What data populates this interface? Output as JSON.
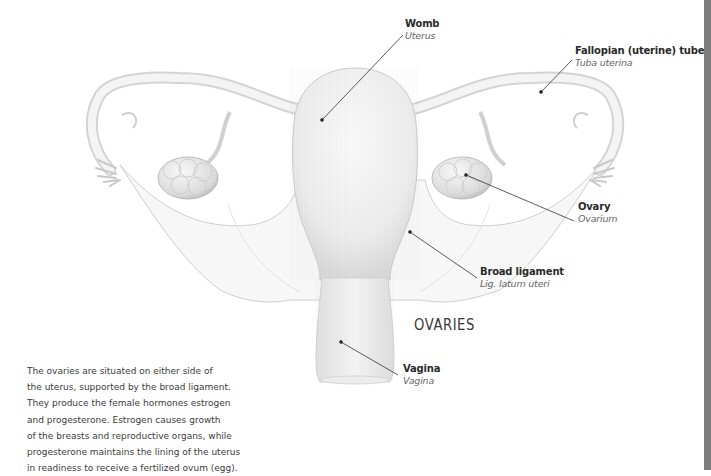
{
  "diagram": {
    "title": "OVARIES",
    "labels": {
      "womb": {
        "name": "Womb",
        "latin": "Uterus"
      },
      "fallopian_tube": {
        "name": "Fallopian (uterine) tube",
        "latin": "Tuba uterina"
      },
      "ovary": {
        "name": "Ovary",
        "latin": "Ovarium"
      },
      "broad_ligament": {
        "name": "Broad ligament",
        "latin": "Lig. latum uteri"
      },
      "vagina": {
        "name": "Vagina",
        "latin": "Vagina"
      }
    },
    "description_lines": [
      "The ovaries are situated on either side of",
      "the uterus, supported by the broad ligament.",
      "They produce the female hormones estrogen",
      "and progesterone. Estrogen causes growth",
      "of the breasts and reproductive organs, while",
      "progesterone maintains the lining of the uterus",
      "in readiness to receive a fertilized ovum (egg)."
    ],
    "colors": {
      "edge_bar": "#7d7d7d",
      "leader_line": "#333333",
      "illustration_stroke": "#c8c8c8"
    }
  }
}
